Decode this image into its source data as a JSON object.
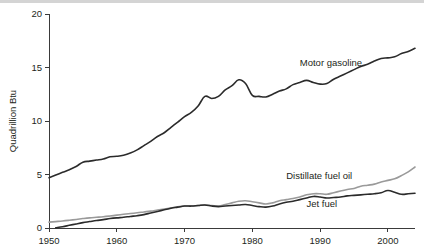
{
  "chart_data": {
    "type": "line",
    "title": "",
    "xlabel": "",
    "ylabel": "Quadrillion Btu",
    "xlim": [
      1950,
      2004
    ],
    "ylim": [
      0,
      20
    ],
    "grid": false,
    "legend_position": "inline-annotations",
    "x_ticks": [
      1950,
      1960,
      1970,
      1980,
      1990,
      2000
    ],
    "x_tick_labels": [
      "1950",
      "1960",
      "1970",
      "1980",
      "1990",
      "2000"
    ],
    "y_ticks": [
      0,
      5,
      10,
      15,
      20
    ],
    "y_tick_labels": [
      "0",
      "5",
      "10",
      "15",
      "20"
    ],
    "series": [
      {
        "name": "Motor gasoline",
        "color": "#2b2b2b",
        "width": 1.6,
        "label_x": 1987,
        "label_y": 15.1,
        "x": [
          1950,
          1951,
          1952,
          1953,
          1954,
          1955,
          1956,
          1957,
          1958,
          1959,
          1960,
          1961,
          1962,
          1963,
          1964,
          1965,
          1966,
          1967,
          1968,
          1969,
          1970,
          1971,
          1972,
          1973,
          1974,
          1975,
          1976,
          1977,
          1978,
          1979,
          1980,
          1981,
          1982,
          1983,
          1984,
          1985,
          1986,
          1987,
          1988,
          1989,
          1990,
          1991,
          1992,
          1993,
          1994,
          1995,
          1996,
          1997,
          1998,
          1999,
          2000,
          2001,
          2002,
          2003,
          2004
        ],
        "values": [
          4.7,
          4.9,
          5.1,
          5.3,
          5.5,
          5.9,
          6.1,
          6.2,
          6.3,
          6.5,
          6.6,
          6.7,
          6.9,
          7.2,
          7.5,
          7.8,
          8.2,
          8.5,
          9.0,
          9.5,
          9.9,
          10.3,
          10.9,
          11.5,
          11.3,
          11.5,
          12.0,
          12.3,
          12.6,
          11.8,
          11.1,
          11.0,
          11.0,
          11.2,
          11.4,
          11.6,
          11.9,
          12.2,
          12.5,
          12.4,
          12.2,
          12.2,
          12.4,
          12.7,
          13.0,
          13.3,
          13.6,
          13.8,
          14.1,
          14.4,
          14.5,
          14.6,
          15.0,
          15.2,
          15.4
        ],
        "pixel_values": [
          4.7,
          4.95,
          5.2,
          5.45,
          5.75,
          6.15,
          6.25,
          6.35,
          6.45,
          6.65,
          6.7,
          6.8,
          7.0,
          7.3,
          7.7,
          8.1,
          8.55,
          8.9,
          9.4,
          9.9,
          10.4,
          10.8,
          11.4,
          12.3,
          12.1,
          12.3,
          12.9,
          13.3,
          13.85,
          13.5,
          12.4,
          12.3,
          12.25,
          12.5,
          12.8,
          13.0,
          13.4,
          13.6,
          13.8,
          13.6,
          13.45,
          13.5,
          13.9,
          14.2,
          14.5,
          14.8,
          15.1,
          15.3,
          15.6,
          15.85,
          15.9,
          16.0,
          16.3,
          16.5,
          16.8
        ]
      },
      {
        "name": "Distillate fuel oil",
        "color": "#9a9a9a",
        "width": 1.6,
        "label_x": 1985,
        "label_y": 4.6,
        "x": [
          1950,
          1951,
          1952,
          1953,
          1954,
          1955,
          1956,
          1957,
          1958,
          1959,
          1960,
          1961,
          1962,
          1963,
          1964,
          1965,
          1966,
          1967,
          1968,
          1969,
          1970,
          1971,
          1972,
          1973,
          1974,
          1975,
          1976,
          1977,
          1978,
          1979,
          1980,
          1981,
          1982,
          1983,
          1984,
          1985,
          1986,
          1987,
          1988,
          1989,
          1990,
          1991,
          1992,
          1993,
          1994,
          1995,
          1996,
          1997,
          1998,
          1999,
          2000,
          2001,
          2002,
          2003,
          2004
        ],
        "values": [
          0.55,
          0.6,
          0.65,
          0.7,
          0.75,
          0.8,
          0.85,
          0.9,
          0.95,
          1.0,
          1.05,
          1.1,
          1.15,
          1.2,
          1.3,
          1.35,
          1.45,
          1.5,
          1.6,
          1.7,
          1.8,
          1.85,
          2.0,
          2.1,
          2.05,
          2.0,
          2.15,
          2.3,
          2.4,
          2.45,
          2.3,
          2.2,
          2.1,
          2.2,
          2.4,
          2.45,
          2.5,
          2.6,
          2.8,
          2.85,
          2.9,
          2.85,
          3.0,
          3.1,
          3.25,
          3.3,
          3.5,
          3.6,
          3.7,
          3.9,
          4.0,
          4.05,
          4.2,
          4.5,
          4.8
        ],
        "pixel_values": [
          0.55,
          0.6,
          0.65,
          0.72,
          0.8,
          0.88,
          0.95,
          1.0,
          1.05,
          1.12,
          1.2,
          1.28,
          1.35,
          1.42,
          1.5,
          1.58,
          1.68,
          1.78,
          1.88,
          1.98,
          2.05,
          2.05,
          2.1,
          2.15,
          2.1,
          2.05,
          2.2,
          2.35,
          2.5,
          2.55,
          2.45,
          2.35,
          2.25,
          2.35,
          2.55,
          2.65,
          2.75,
          2.9,
          3.1,
          3.2,
          3.2,
          3.15,
          3.3,
          3.45,
          3.6,
          3.7,
          3.9,
          4.0,
          4.1,
          4.3,
          4.45,
          4.6,
          4.9,
          5.25,
          5.7
        ]
      },
      {
        "name": "Jet fuel",
        "color": "#2b2b2b",
        "width": 1.6,
        "label_x": 1988,
        "label_y": 2.0,
        "x": [
          1951,
          1952,
          1953,
          1954,
          1955,
          1956,
          1957,
          1958,
          1959,
          1960,
          1961,
          1962,
          1963,
          1964,
          1965,
          1966,
          1967,
          1968,
          1969,
          1970,
          1971,
          1972,
          1973,
          1974,
          1975,
          1976,
          1977,
          1978,
          1979,
          1980,
          1981,
          1982,
          1983,
          1984,
          1985,
          1986,
          1987,
          1988,
          1989,
          1990,
          1991,
          1992,
          1993,
          1994,
          1995,
          1996,
          1997,
          1998,
          1999,
          2000,
          2001,
          2002,
          2003,
          2004
        ],
        "values": [
          0.02,
          0.1,
          0.2,
          0.3,
          0.4,
          0.5,
          0.6,
          0.7,
          0.8,
          0.85,
          0.95,
          1.05,
          1.1,
          1.2,
          1.35,
          1.5,
          1.65,
          1.8,
          1.9,
          2.0,
          2.0,
          2.05,
          2.1,
          2.0,
          2.0,
          2.05,
          2.1,
          2.15,
          2.2,
          2.1,
          2.0,
          1.95,
          2.05,
          2.2,
          2.3,
          2.4,
          2.55,
          2.7,
          2.85,
          2.9,
          2.8,
          2.85,
          2.9,
          3.0,
          3.05,
          3.1,
          3.15,
          3.2,
          3.25,
          3.4,
          3.3,
          3.1,
          3.15,
          3.2
        ],
        "pixel_values": [
          0.02,
          0.12,
          0.25,
          0.38,
          0.5,
          0.6,
          0.7,
          0.78,
          0.88,
          0.95,
          1.0,
          1.08,
          1.15,
          1.25,
          1.4,
          1.55,
          1.7,
          1.85,
          1.95,
          2.05,
          2.05,
          2.1,
          2.15,
          2.05,
          2.0,
          2.05,
          2.1,
          2.15,
          2.2,
          2.1,
          2.0,
          1.95,
          2.05,
          2.25,
          2.4,
          2.5,
          2.65,
          2.8,
          2.95,
          2.9,
          2.8,
          2.85,
          2.9,
          3.0,
          3.05,
          3.1,
          3.15,
          3.2,
          3.3,
          3.5,
          3.35,
          3.15,
          3.2,
          3.25
        ]
      }
    ]
  },
  "axes": {
    "y_title": "Quadrillion Btu"
  },
  "labels": {
    "motor_gasoline": "Motor gasoline",
    "distillate_fuel_oil": "Distillate fuel oil",
    "jet_fuel": "Jet fuel"
  }
}
